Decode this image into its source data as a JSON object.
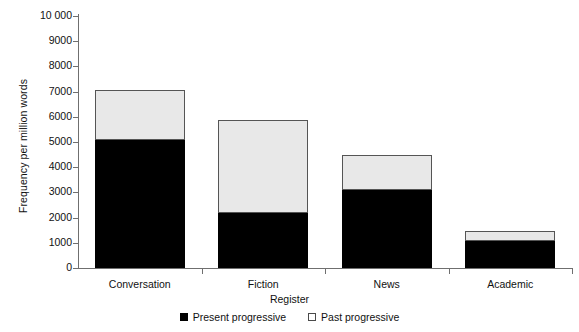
{
  "chart_data": {
    "type": "bar",
    "subtype": "stacked-bar",
    "title": "",
    "xlabel": "Register",
    "ylabel": "Frequency per million words",
    "categories": [
      "Conversation",
      "Fiction",
      "News",
      "Academic"
    ],
    "series": [
      {
        "name": "Present progressive",
        "color": "#000000",
        "values": [
          5080,
          2180,
          3100,
          1070
        ]
      },
      {
        "name": "Past progressive",
        "color": "#e8e8e8",
        "values": [
          1980,
          3690,
          1380,
          400
        ]
      }
    ],
    "totals": [
      7060,
      5870,
      4480,
      1470
    ],
    "ylim": [
      0,
      10000
    ],
    "ytick_values": [
      0,
      1000,
      2000,
      3000,
      4000,
      5000,
      6000,
      7000,
      8000,
      9000,
      10000
    ],
    "ytick_labels": [
      "0",
      "1000",
      "2000",
      "3000",
      "4000",
      "5000",
      "6000",
      "7000",
      "8000",
      "9000",
      "10 000"
    ],
    "grid": false,
    "legend_position": "bottom-center",
    "legend_entries": [
      {
        "label": "Present progressive",
        "marker": "filled-square"
      },
      {
        "label": "Past progressive",
        "marker": "open-square"
      }
    ]
  },
  "axes": {
    "y_title": "Frequency per million words",
    "x_title": "Register"
  }
}
